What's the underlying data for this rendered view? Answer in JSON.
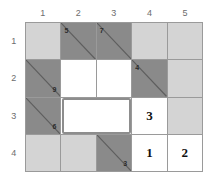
{
  "grid": {
    "column_headers": [
      "1",
      "2",
      "3",
      "4",
      "5"
    ],
    "row_headers": [
      "1",
      "2",
      "3",
      "4"
    ],
    "colors": {
      "light": "#d4d4d4",
      "white": "#ffffff",
      "dark": "#8a8a8a",
      "grid_line": "#9a9a9a",
      "diagonal": "#5e5e5e",
      "selection_border": "#8d8d8d",
      "header_text": "#6d6d6d",
      "clue_text": "#2b2b2b",
      "answer_text": "#111111"
    },
    "cells": [
      {
        "row": 1,
        "col": 1,
        "fill": "light",
        "diagonal": false,
        "clue": "",
        "clue_pos": "",
        "answer": ""
      },
      {
        "row": 1,
        "col": 2,
        "fill": "dark",
        "diagonal": true,
        "clue": "5",
        "clue_pos": "tl",
        "answer": ""
      },
      {
        "row": 1,
        "col": 3,
        "fill": "dark",
        "diagonal": true,
        "clue": "7",
        "clue_pos": "tl",
        "answer": ""
      },
      {
        "row": 1,
        "col": 4,
        "fill": "light",
        "diagonal": false,
        "clue": "",
        "clue_pos": "",
        "answer": ""
      },
      {
        "row": 1,
        "col": 5,
        "fill": "light",
        "diagonal": false,
        "clue": "",
        "clue_pos": "",
        "answer": ""
      },
      {
        "row": 2,
        "col": 1,
        "fill": "dark",
        "diagonal": true,
        "clue": "9",
        "clue_pos": "br",
        "answer": ""
      },
      {
        "row": 2,
        "col": 2,
        "fill": "white",
        "diagonal": false,
        "clue": "",
        "clue_pos": "",
        "answer": ""
      },
      {
        "row": 2,
        "col": 3,
        "fill": "white",
        "diagonal": false,
        "clue": "",
        "clue_pos": "",
        "answer": ""
      },
      {
        "row": 2,
        "col": 4,
        "fill": "dark",
        "diagonal": true,
        "clue": "4",
        "clue_pos": "tl",
        "answer": ""
      },
      {
        "row": 2,
        "col": 5,
        "fill": "light",
        "diagonal": false,
        "clue": "",
        "clue_pos": "",
        "answer": ""
      },
      {
        "row": 3,
        "col": 1,
        "fill": "dark",
        "diagonal": true,
        "clue": "6",
        "clue_pos": "br",
        "answer": ""
      },
      {
        "row": 3,
        "col": 2,
        "fill": "white",
        "diagonal": false,
        "clue": "",
        "clue_pos": "",
        "answer": ""
      },
      {
        "row": 3,
        "col": 3,
        "fill": "white",
        "diagonal": false,
        "clue": "",
        "clue_pos": "",
        "answer": ""
      },
      {
        "row": 3,
        "col": 4,
        "fill": "white",
        "diagonal": false,
        "clue": "",
        "clue_pos": "",
        "answer": "3"
      },
      {
        "row": 3,
        "col": 5,
        "fill": "light",
        "diagonal": false,
        "clue": "",
        "clue_pos": "",
        "answer": ""
      },
      {
        "row": 4,
        "col": 1,
        "fill": "light",
        "diagonal": false,
        "clue": "",
        "clue_pos": "",
        "answer": ""
      },
      {
        "row": 4,
        "col": 2,
        "fill": "light",
        "diagonal": false,
        "clue": "",
        "clue_pos": "",
        "answer": ""
      },
      {
        "row": 4,
        "col": 3,
        "fill": "dark",
        "diagonal": true,
        "clue": "3",
        "clue_pos": "br",
        "answer": ""
      },
      {
        "row": 4,
        "col": 4,
        "fill": "white",
        "diagonal": false,
        "clue": "",
        "clue_pos": "",
        "answer": "1"
      },
      {
        "row": 4,
        "col": 5,
        "fill": "white",
        "diagonal": false,
        "clue": "",
        "clue_pos": "",
        "answer": "2"
      }
    ],
    "selection": {
      "start_row": 3,
      "start_col": 2,
      "end_row": 3,
      "end_col": 3
    }
  }
}
